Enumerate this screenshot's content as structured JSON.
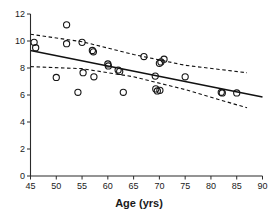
{
  "chart_data": {
    "type": "scatter",
    "title": "",
    "subtitle": "",
    "xlabel": "Age (yrs)",
    "ylabel": "",
    "xlim": [
      45,
      90
    ],
    "ylim": [
      0,
      12
    ],
    "xticks": [
      45,
      50,
      55,
      60,
      65,
      70,
      75,
      80,
      85,
      90
    ],
    "yticks": [
      0,
      2,
      4,
      6,
      8,
      10,
      12
    ],
    "xtick_labels": [
      "45",
      "50",
      "55",
      "60",
      "65",
      "70",
      "75",
      "80",
      "85",
      "90"
    ],
    "ytick_labels": [
      "0",
      "2",
      "4",
      "6",
      "8",
      "10",
      "12"
    ],
    "grid": false,
    "legend": null,
    "marker": "open-circle",
    "points": [
      {
        "x": 45.7,
        "y": 9.9
      },
      {
        "x": 46.0,
        "y": 9.5
      },
      {
        "x": 50.0,
        "y": 7.3
      },
      {
        "x": 52.0,
        "y": 11.2
      },
      {
        "x": 52.0,
        "y": 9.8
      },
      {
        "x": 54.2,
        "y": 6.2
      },
      {
        "x": 55.0,
        "y": 9.9
      },
      {
        "x": 55.2,
        "y": 7.65
      },
      {
        "x": 57.0,
        "y": 9.3
      },
      {
        "x": 57.2,
        "y": 9.2
      },
      {
        "x": 57.3,
        "y": 7.35
      },
      {
        "x": 60.0,
        "y": 8.3
      },
      {
        "x": 60.1,
        "y": 8.15
      },
      {
        "x": 62.0,
        "y": 7.85
      },
      {
        "x": 62.3,
        "y": 7.75
      },
      {
        "x": 63.0,
        "y": 6.2
      },
      {
        "x": 67.0,
        "y": 8.85
      },
      {
        "x": 69.2,
        "y": 7.4
      },
      {
        "x": 69.3,
        "y": 6.45
      },
      {
        "x": 69.6,
        "y": 6.3
      },
      {
        "x": 70.1,
        "y": 6.35
      },
      {
        "x": 70.0,
        "y": 8.35
      },
      {
        "x": 70.3,
        "y": 8.45
      },
      {
        "x": 70.9,
        "y": 8.65
      },
      {
        "x": 75.0,
        "y": 7.35
      },
      {
        "x": 82.0,
        "y": 6.2
      },
      {
        "x": 82.2,
        "y": 6.15
      },
      {
        "x": 85.0,
        "y": 6.15
      }
    ],
    "fit_line": {
      "name": "regression-line",
      "style": "solid",
      "x": [
        45,
        90
      ],
      "y": [
        9.3,
        5.85
      ]
    },
    "confidence_band_upper": {
      "name": "upper-confidence-limit",
      "style": "dashed",
      "x": [
        45,
        55,
        65,
        75,
        87
      ],
      "y": [
        10.5,
        9.95,
        9.0,
        8.2,
        7.65
      ]
    },
    "confidence_band_lower": {
      "name": "lower-confidence-limit",
      "style": "dashed",
      "x": [
        45,
        55,
        65,
        75,
        87
      ],
      "y": [
        8.1,
        7.95,
        7.35,
        6.4,
        5.05
      ]
    }
  }
}
